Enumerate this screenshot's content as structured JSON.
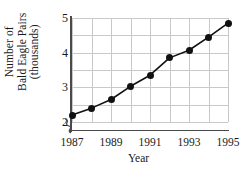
{
  "chart_data": {
    "type": "line",
    "title": "",
    "xlabel": "Year",
    "ylabel": "Number of Bald Eagle Pairs (thousands)",
    "ylabel_lines": [
      "Number of",
      "Bald Eagle Pairs",
      "(thousands)"
    ],
    "x": [
      1987,
      1988,
      1989,
      1990,
      1991,
      1992,
      1993,
      1994,
      1995
    ],
    "values": [
      2.2,
      2.4,
      2.65,
      3.03,
      3.35,
      3.85,
      4.07,
      4.45,
      4.85
    ],
    "xtick_labels": [
      "1987",
      "1989",
      "1991",
      "1993",
      "1995"
    ],
    "xticks": [
      1987,
      1989,
      1991,
      1993,
      1995
    ],
    "ytick_labels": [
      "2",
      "3",
      "4",
      "5"
    ],
    "yticks": [
      2,
      3,
      4,
      5
    ],
    "xlim": [
      1987,
      1995
    ],
    "ylim": [
      2,
      5
    ],
    "grid": true,
    "legend": "none",
    "axis_break": "y-axis break below 2",
    "marker": "filled-circle",
    "line_color": "#111111",
    "marker_color": "#111111",
    "grid_color": "#c9c9c9",
    "axis_color": "#4a4a4a",
    "background": "#ffffff"
  }
}
